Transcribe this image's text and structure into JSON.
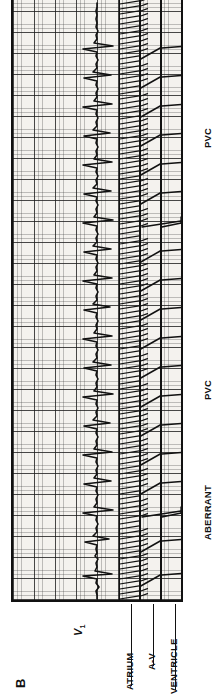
{
  "figure": {
    "panel_letter": "B",
    "orientation_note": "rotated",
    "lead_label": "V",
    "lead_subscript": "1",
    "background_color": "#f4f2ee",
    "ink_color": "#111111",
    "grid": {
      "fine_spacing_px": 4.2,
      "coarse_spacing_px": 21,
      "fine_color": "#3c3c3c",
      "coarse_color": "#191919"
    }
  },
  "ladder": {
    "tiers": [
      {
        "id": "atrium",
        "label": "ATRIUM"
      },
      {
        "id": "av",
        "label": "A-V"
      },
      {
        "id": "ventricle",
        "label": "VENTRICLE"
      }
    ]
  },
  "annotations": [
    {
      "id": "pvc-top",
      "label": "PVC"
    },
    {
      "id": "pvc-mid",
      "label": "PVC"
    },
    {
      "id": "aberrant",
      "label": "ABERRANT"
    }
  ],
  "chart_data": {
    "type": "line",
    "title": "",
    "subtitle": "",
    "xlabel": "",
    "ylabel": "",
    "grid": true,
    "legend": "none",
    "series": [
      {
        "name": "V1 surface ECG",
        "comment": "rapid irregular atrial flutter/fibrillation with variable ventricular response; two PVCs and one aberrantly conducted beat",
        "points": "1,84 5,84 9,83 13,86 17,83 21,84 24,70 26,99 29,82 33,84 37,83 41,85 44,82 47,84 51,83 55,84 58,72 61,96 64,80 68,84 72,83 76,85 80,83 84,84 87,70 90,100 93,81 97,84 101,83 105,85 109,83 113,84 116,71 119,98 122,81 126,84 130,83 134,85 138,83 142,84 145,70 148,99 151,81 155,84 159,83 163,85 167,83 171,84 174,71 177,97 180,80 184,84 188,83 192,85 196,83 200,84 203,70 206,100 209,81 213,84 217,83 221,85 225,83 229,84 232,71 235,98 238,80 242,84 246,83 250,85 254,83 258,84 261,70 264,99 267,81 271,84 275,83 279,85 283,83 287,84 290,71 293,97 296,80 300,84 304,83 308,85 312,83 316,84 319,70 322,99 325,81 329,84 333,83 337,85 341,83 345,84 348,71 351,98 354,80 358,84 362,83 366,85 370,83 374,84 377,70 380,100 383,81 387,84 391,83 395,85 399,83 403,84 406,71 409,98 412,80 416,84 420,83 424,85 428,83 432,84 435,70 438,99 441,81 445,84 449,83 453,85 457,83 461,84 464,71 467,97 470,80 474,84 478,83 482,85 486,83 490,84 493,70 496,99 499,81 503,84 507,83 511,85 515,83 519,84 522,71 525,98 528,80 532,84 536,83 540,85 544,83 548,84 551,70 554,100 557,81 561,84 565,83 569,85 573,83 577,84 581,83 585,84 589,83 593,84 597,84"
      }
    ],
    "beats": [
      {
        "x": 25,
        "type": "sinus"
      },
      {
        "x": 59,
        "type": "sinus"
      },
      {
        "x": 88,
        "type": "PVC"
      },
      {
        "x": 117,
        "type": "sinus"
      },
      {
        "x": 146,
        "type": "sinus"
      },
      {
        "x": 175,
        "type": "sinus"
      },
      {
        "x": 204,
        "type": "sinus"
      },
      {
        "x": 233,
        "type": "sinus"
      },
      {
        "x": 262,
        "type": "sinus"
      },
      {
        "x": 291,
        "type": "ABERRANT"
      },
      {
        "x": 320,
        "type": "sinus"
      },
      {
        "x": 349,
        "type": "sinus"
      },
      {
        "x": 378,
        "type": "PVC"
      },
      {
        "x": 407,
        "type": "sinus"
      },
      {
        "x": 436,
        "type": "sinus"
      },
      {
        "x": 465,
        "type": "sinus"
      },
      {
        "x": 494,
        "type": "sinus"
      },
      {
        "x": 523,
        "type": "sinus"
      },
      {
        "x": 552,
        "type": "sinus"
      }
    ],
    "atrial_rate_comment": "very rapid, continuous atrial activity",
    "ylim": [
      0,
      168
    ],
    "xlim": [
      0,
      600
    ]
  }
}
